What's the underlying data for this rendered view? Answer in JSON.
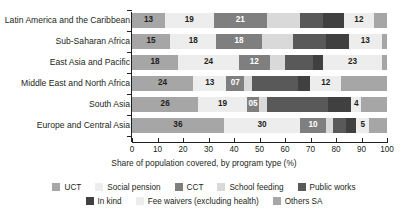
{
  "chart_data": {
    "type": "bar",
    "orientation": "horizontal",
    "stacked": true,
    "xlabel": "Share of population covered, by program type (%)",
    "ylabel": "",
    "title": "",
    "xlim": [
      0,
      100
    ],
    "xticks": [
      0,
      10,
      20,
      30,
      40,
      50,
      60,
      70,
      80,
      90,
      100
    ],
    "grid": false,
    "legend_position": "bottom",
    "categories": [
      "Latin America and the Caribbean",
      "Sub-Saharan Africa",
      "East Asia and Pacific",
      "Middle East and North Africa",
      "South Asia",
      "Europe and Central Asia"
    ],
    "series": [
      {
        "name": "UCT",
        "color": "#a6a6a6",
        "values": [
          13,
          15,
          18,
          24,
          26,
          36
        ]
      },
      {
        "name": "Social pension",
        "color": "#ededed",
        "values": [
          19,
          18,
          24,
          13,
          19,
          30
        ]
      },
      {
        "name": "CCT",
        "color": "#7f7f7f",
        "values": [
          21,
          18,
          12,
          7,
          5,
          10
        ]
      },
      {
        "name": "School feeding",
        "color": "#d9d9d9",
        "values": [
          13,
          12,
          6,
          3,
          3,
          3
        ]
      },
      {
        "name": "Public works",
        "color": "#595959",
        "values": [
          9,
          13,
          11,
          18,
          24,
          5
        ]
      },
      {
        "name": "In kind",
        "color": "#404040",
        "values": [
          8,
          9,
          4,
          5,
          9,
          4
        ]
      },
      {
        "name": "Fee waivers (excluding health)",
        "color": "#ededed",
        "values": [
          12,
          13,
          23,
          12,
          4,
          5
        ]
      },
      {
        "name": "Others SA",
        "color": "#a6a6a6",
        "values": [
          5,
          2,
          2,
          18,
          10,
          7
        ]
      }
    ],
    "bar_labels": [
      [
        {
          "text": "13",
          "series": "UCT",
          "dark_text": true
        },
        {
          "text": "19",
          "series": "Social pension",
          "dark_text": true
        },
        {
          "text": "21",
          "series": "CCT",
          "dark_text": false
        },
        {
          "text": "",
          "series": "School feeding",
          "dark_text": true
        },
        {
          "text": "",
          "series": "Public works",
          "dark_text": false
        },
        {
          "text": "",
          "series": "In kind",
          "dark_text": false
        },
        {
          "text": "12",
          "series": "Fee waivers (excluding health)",
          "dark_text": true
        },
        {
          "text": "",
          "series": "Others SA",
          "dark_text": true
        }
      ],
      [
        {
          "text": "15",
          "series": "UCT",
          "dark_text": true
        },
        {
          "text": "18",
          "series": "Social pension",
          "dark_text": true
        },
        {
          "text": "18",
          "series": "CCT",
          "dark_text": false
        },
        {
          "text": "",
          "series": "School feeding",
          "dark_text": true
        },
        {
          "text": "",
          "series": "Public works",
          "dark_text": false
        },
        {
          "text": "",
          "series": "In kind",
          "dark_text": false
        },
        {
          "text": "13",
          "series": "Fee waivers (excluding health)",
          "dark_text": true
        },
        {
          "text": "",
          "series": "Others SA",
          "dark_text": true
        }
      ],
      [
        {
          "text": "18",
          "series": "UCT",
          "dark_text": true
        },
        {
          "text": "24",
          "series": "Social pension",
          "dark_text": true
        },
        {
          "text": "12",
          "series": "CCT",
          "dark_text": false
        },
        {
          "text": "",
          "series": "School feeding",
          "dark_text": true
        },
        {
          "text": "",
          "series": "Public works",
          "dark_text": false
        },
        {
          "text": "",
          "series": "In kind",
          "dark_text": false
        },
        {
          "text": "23",
          "series": "Fee waivers (excluding health)",
          "dark_text": true
        },
        {
          "text": "",
          "series": "Others SA",
          "dark_text": true
        }
      ],
      [
        {
          "text": "24",
          "series": "UCT",
          "dark_text": true
        },
        {
          "text": "13",
          "series": "Social pension",
          "dark_text": true
        },
        {
          "text": "07",
          "series": "CCT",
          "dark_text": false
        },
        {
          "text": "",
          "series": "School feeding",
          "dark_text": true
        },
        {
          "text": "",
          "series": "Public works",
          "dark_text": false
        },
        {
          "text": "",
          "series": "In kind",
          "dark_text": false
        },
        {
          "text": "12",
          "series": "Fee waivers (excluding health)",
          "dark_text": true
        },
        {
          "text": "",
          "series": "Others SA",
          "dark_text": true
        }
      ],
      [
        {
          "text": "26",
          "series": "UCT",
          "dark_text": true
        },
        {
          "text": "19",
          "series": "Social pension",
          "dark_text": true
        },
        {
          "text": "05",
          "series": "CCT",
          "dark_text": false
        },
        {
          "text": "",
          "series": "School feeding",
          "dark_text": true
        },
        {
          "text": "",
          "series": "Public works",
          "dark_text": false
        },
        {
          "text": "",
          "series": "In kind",
          "dark_text": false
        },
        {
          "text": "4",
          "series": "Fee waivers (excluding health)",
          "dark_text": true
        },
        {
          "text": "",
          "series": "Others SA",
          "dark_text": true
        }
      ],
      [
        {
          "text": "36",
          "series": "UCT",
          "dark_text": true
        },
        {
          "text": "30",
          "series": "Social pension",
          "dark_text": true
        },
        {
          "text": "10",
          "series": "CCT",
          "dark_text": false
        },
        {
          "text": "",
          "series": "School feeding",
          "dark_text": true
        },
        {
          "text": "",
          "series": "Public works",
          "dark_text": false
        },
        {
          "text": "",
          "series": "In kind",
          "dark_text": false
        },
        {
          "text": "5",
          "series": "Fee waivers (excluding health)",
          "dark_text": true
        },
        {
          "text": "",
          "series": "Others SA",
          "dark_text": true
        }
      ]
    ]
  },
  "legend": {
    "rows": [
      [
        "UCT",
        "Social pension",
        "CCT",
        "School feeding",
        "Public works"
      ],
      [
        "In kind",
        "Fee waivers (excluding health)",
        "Others SA"
      ]
    ]
  }
}
